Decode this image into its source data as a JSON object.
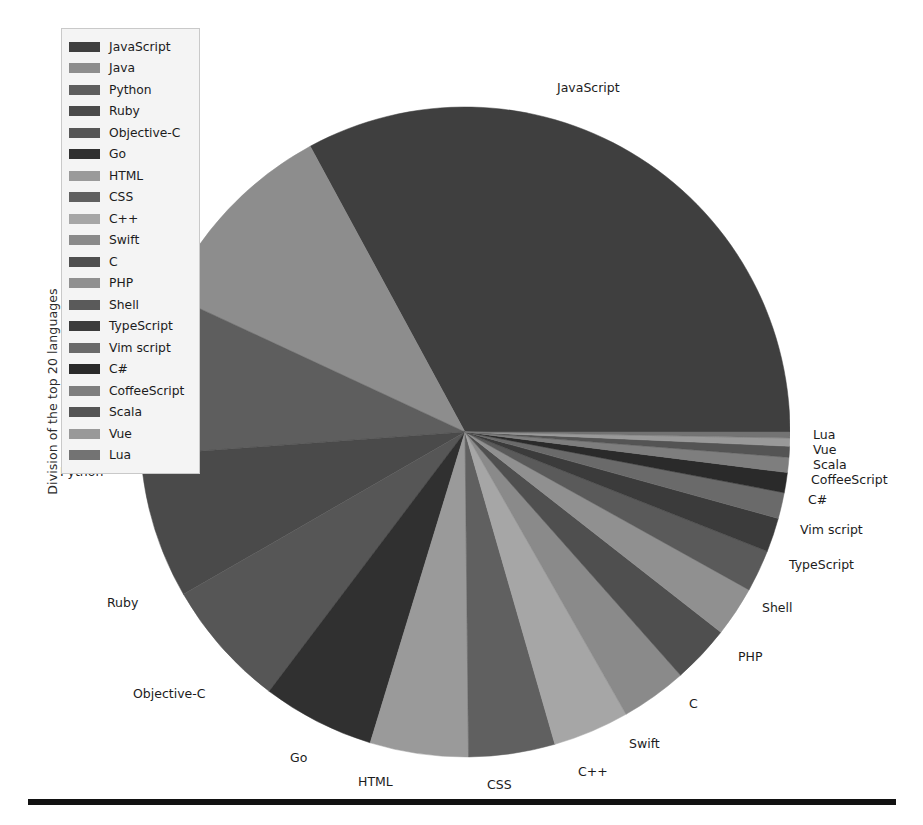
{
  "axis": {
    "ylabel": "Division of the top 20 languages"
  },
  "legend": {
    "items": [
      {
        "label": "JavaScript",
        "color": "#3f3f3f"
      },
      {
        "label": "Java",
        "color": "#8d8d8d"
      },
      {
        "label": "Python",
        "color": "#5e5e5e"
      },
      {
        "label": "Ruby",
        "color": "#4a4a4a"
      },
      {
        "label": "Objective-C",
        "color": "#565656"
      },
      {
        "label": "Go",
        "color": "#303030"
      },
      {
        "label": "HTML",
        "color": "#9a9a9a"
      },
      {
        "label": "CSS",
        "color": "#606060"
      },
      {
        "label": "C++",
        "color": "#a6a6a6"
      },
      {
        "label": "Swift",
        "color": "#8a8a8a"
      },
      {
        "label": "C",
        "color": "#4f4f4f"
      },
      {
        "label": "PHP",
        "color": "#909090"
      },
      {
        "label": "Shell",
        "color": "#5a5a5a"
      },
      {
        "label": "TypeScript",
        "color": "#3b3b3b"
      },
      {
        "label": "Vim script",
        "color": "#6a6a6a"
      },
      {
        "label": "C#",
        "color": "#2a2a2a"
      },
      {
        "label": "CoffeeScript",
        "color": "#7e7e7e"
      },
      {
        "label": "Scala",
        "color": "#545454"
      },
      {
        "label": "Vue",
        "color": "#999999"
      },
      {
        "label": "Lua",
        "color": "#737373"
      }
    ]
  },
  "chart_data": {
    "type": "pie",
    "title": "",
    "xlabel": "",
    "ylabel": "Division of the top 20 languages",
    "legend_position": "upper-left",
    "start_angle": 0,
    "direction": "counterclockwise",
    "center": [
      458,
      432
    ],
    "radius": 325,
    "labels": [
      "JavaScript",
      "Java",
      "Python",
      "Ruby",
      "Objective-C",
      "Go",
      "HTML",
      "CSS",
      "C++",
      "Swift",
      "C",
      "PHP",
      "Shell",
      "TypeScript",
      "Vim script",
      "C#",
      "CoffeeScript",
      "Scala",
      "Vue",
      "Lua"
    ],
    "values": [
      33.0,
      10.2,
      8.1,
      7.2,
      6.4,
      5.6,
      4.9,
      4.3,
      3.8,
      3.3,
      2.9,
      2.5,
      2.1,
      1.7,
      1.3,
      1.0,
      0.75,
      0.55,
      0.4,
      0.3
    ],
    "unit": "percent",
    "colors": [
      "#3f3f3f",
      "#8d8d8d",
      "#5e5e5e",
      "#4a4a4a",
      "#565656",
      "#303030",
      "#9a9a9a",
      "#606060",
      "#a6a6a6",
      "#8a8a8a",
      "#4f4f4f",
      "#909090",
      "#5a5a5a",
      "#3b3b3b",
      "#6a6a6a",
      "#2a2a2a",
      "#7e7e7e",
      "#545454",
      "#999999",
      "#737373"
    ]
  },
  "slice_labels": [
    {
      "label": "JavaScript",
      "x": 557,
      "y": 82,
      "align": "left"
    },
    {
      "label": "Java",
      "x": 116,
      "y": 307,
      "align": "left"
    },
    {
      "label": "Python",
      "x": 60,
      "y": 466,
      "align": "left"
    },
    {
      "label": "Ruby",
      "x": 107,
      "y": 597,
      "align": "left"
    },
    {
      "label": "Objective-C",
      "x": 133,
      "y": 688,
      "align": "left"
    },
    {
      "label": "Go",
      "x": 290,
      "y": 752,
      "align": "left"
    },
    {
      "label": "HTML",
      "x": 358,
      "y": 776,
      "align": "left"
    },
    {
      "label": "CSS",
      "x": 487,
      "y": 779,
      "align": "left"
    },
    {
      "label": "C++",
      "x": 578,
      "y": 766,
      "align": "left"
    },
    {
      "label": "Swift",
      "x": 629,
      "y": 738,
      "align": "left"
    },
    {
      "label": "C",
      "x": 689,
      "y": 698,
      "align": "left"
    },
    {
      "label": "PHP",
      "x": 738,
      "y": 651,
      "align": "left"
    },
    {
      "label": "Shell",
      "x": 762,
      "y": 602,
      "align": "left"
    },
    {
      "label": "TypeScript",
      "x": 789,
      "y": 559,
      "align": "left"
    },
    {
      "label": "Vim script",
      "x": 800,
      "y": 524,
      "align": "left"
    },
    {
      "label": "C#",
      "x": 808,
      "y": 494,
      "align": "left"
    },
    {
      "label": "CoffeeScript",
      "x": 811,
      "y": 474,
      "align": "left"
    },
    {
      "label": "Scala",
      "x": 813,
      "y": 459,
      "align": "left"
    },
    {
      "label": "Vue",
      "x": 813,
      "y": 444,
      "align": "left"
    },
    {
      "label": "Lua",
      "x": 813,
      "y": 429,
      "align": "left"
    }
  ]
}
